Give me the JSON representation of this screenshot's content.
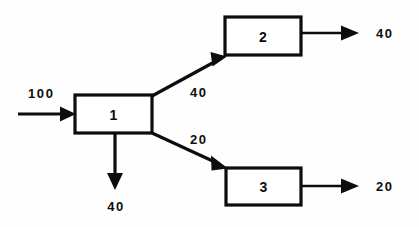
{
  "diagram": {
    "type": "flow-diagram",
    "background_color": "#fefefe",
    "stroke_color": "#0d0d0d",
    "title": "",
    "nodes": [
      {
        "id": "1",
        "label": "1",
        "x": 75,
        "y": 95,
        "w": 77,
        "h": 38
      },
      {
        "id": "2",
        "label": "2",
        "x": 225,
        "y": 17,
        "w": 76,
        "h": 38
      },
      {
        "id": "3",
        "label": "3",
        "x": 226,
        "y": 168,
        "w": 75,
        "h": 37
      }
    ],
    "flows": [
      {
        "name": "input-flow",
        "label": "100",
        "from": "external",
        "to": "1",
        "direction": "right",
        "label_x": 30,
        "label_y": 93
      },
      {
        "name": "flow-1-to-2",
        "label": "40",
        "from": "1",
        "to": "2",
        "direction": "up-right",
        "label_x": 190,
        "label_y": 92
      },
      {
        "name": "flow-1-to-3",
        "label": "20",
        "from": "1",
        "to": "3",
        "direction": "down-right",
        "label_x": 190,
        "label_y": 139
      },
      {
        "name": "loss-flow-node-1",
        "label": "40",
        "from": "1",
        "to": "external",
        "direction": "down",
        "label_x": 115,
        "label_y": 206
      },
      {
        "name": "output-flow-node-2",
        "label": "40",
        "from": "2",
        "to": "external",
        "direction": "right",
        "label_x": 388,
        "label_y": 33
      },
      {
        "name": "output-flow-node-3",
        "label": "20",
        "from": "3",
        "to": "external",
        "direction": "right",
        "label_x": 388,
        "label_y": 186
      }
    ]
  }
}
